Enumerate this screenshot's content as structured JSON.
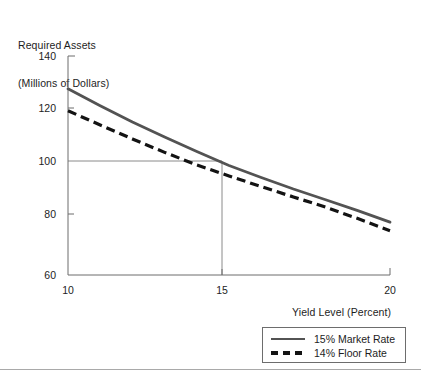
{
  "chart_data": {
    "type": "line",
    "title": "",
    "ylabel": "Required Assets\n(Millions of Dollars)",
    "ylabel_line1": "Required Assets",
    "ylabel_line2": "(Millions of Dollars)",
    "xlabel": "Yield Level (Percent)",
    "xlim": [
      10,
      20
    ],
    "ylim": [
      60,
      140
    ],
    "xticks": [
      10,
      15,
      20
    ],
    "xtick_labels": [
      "10",
      "15",
      "20"
    ],
    "yticks": [
      60,
      80,
      100,
      120,
      140
    ],
    "ytick_labels": [
      "60",
      "80",
      "100",
      "120",
      "140"
    ],
    "grid": false,
    "legend_position": "bottom-right",
    "series": [
      {
        "name": "15% Market Rate",
        "style": "solid",
        "color": "#535353",
        "x": [
          10,
          11,
          12,
          13,
          14,
          15,
          16,
          17,
          18,
          19,
          20
        ],
        "values": [
          128.0,
          121.8,
          115.9,
          110.4,
          105.1,
          100.0,
          95.6,
          91.4,
          87.5,
          83.5,
          79.3
        ]
      },
      {
        "name": "14% Floor Rate",
        "style": "dashed",
        "color": "#131313",
        "x": [
          10,
          11,
          12,
          13,
          14,
          15,
          16,
          17,
          18,
          19,
          20
        ],
        "values": [
          120.0,
          114.8,
          109.7,
          104.8,
          100.2,
          96.2,
          92.3,
          88.5,
          84.8,
          80.6,
          76.2
        ]
      }
    ],
    "reference_lines": [
      {
        "name": "required-assets-at-15-percent",
        "orientation": "horizontal",
        "y": 100,
        "x_from": 10,
        "x_to": 15,
        "color": "#8a8a8a"
      },
      {
        "name": "yield-level-15-percent",
        "orientation": "vertical",
        "x": 15,
        "y_from": 100,
        "y_to": 60,
        "color": "#8a8a8a"
      }
    ],
    "annotations": []
  },
  "legend": {
    "entries": [
      {
        "label": "15% Market Rate",
        "style": "solid"
      },
      {
        "label": "14% Floor Rate",
        "style": "dashed"
      }
    ]
  },
  "colors": {
    "axis": "#6d6d6d",
    "market_rate_line": "#535353",
    "floor_rate_line": "#131313",
    "reference_line": "#8a8a8a",
    "text": "#1d1d1d",
    "footer_rule": "#a9a9a9",
    "background": "#ffffff"
  }
}
